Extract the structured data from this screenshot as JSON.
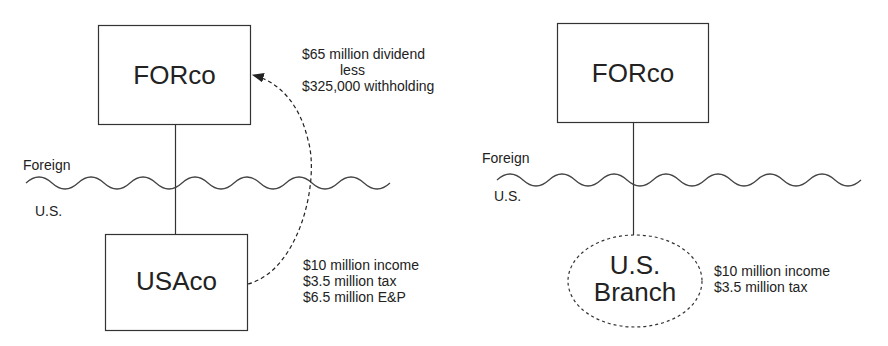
{
  "left_diagram": {
    "parent": {
      "name": "FORco"
    },
    "subsidiary": {
      "name": "USAco"
    },
    "region_labels": {
      "foreign": "Foreign",
      "us": "U.S."
    },
    "dividend_note": {
      "line1": "$65 million dividend",
      "line2": "less",
      "line3": "$325,000 withholding"
    },
    "subsidiary_note": {
      "line1": "$10 million income",
      "line2": "$3.5 million tax",
      "line3": "$6.5 million E&P"
    }
  },
  "right_diagram": {
    "parent": {
      "name": "FORco"
    },
    "branch": {
      "line1": "U.S.",
      "line2": "Branch"
    },
    "region_labels": {
      "foreign": "Foreign",
      "us": "U.S."
    },
    "branch_note": {
      "line1": "$10 million income",
      "line2": "$3.5 million tax"
    }
  },
  "colors": {
    "stroke": "#333333",
    "text": "#222222",
    "background": "#ffffff"
  }
}
